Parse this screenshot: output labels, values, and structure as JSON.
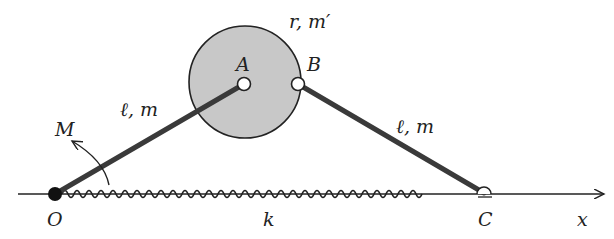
{
  "diagram": {
    "type": "mechanism",
    "colors": {
      "ink": "#222222",
      "disk_fill": "#c8c8c8",
      "background": "#ffffff"
    },
    "points": {
      "O": {
        "label": "O",
        "x": 55,
        "y": 194
      },
      "A": {
        "label": "A",
        "x": 244,
        "y": 84
      },
      "B": {
        "label": "B",
        "x": 298,
        "y": 84
      },
      "C": {
        "label": "C",
        "x": 484,
        "y": 193
      }
    },
    "disk": {
      "label": "r, m′",
      "cx": 245,
      "cy": 82,
      "r": 56
    },
    "rod_OA": {
      "label": "ℓ, m"
    },
    "rod_BC": {
      "label": "ℓ, m"
    },
    "moment": {
      "label": "M"
    },
    "spring": {
      "label": "k"
    },
    "axis": {
      "label": "x"
    }
  }
}
